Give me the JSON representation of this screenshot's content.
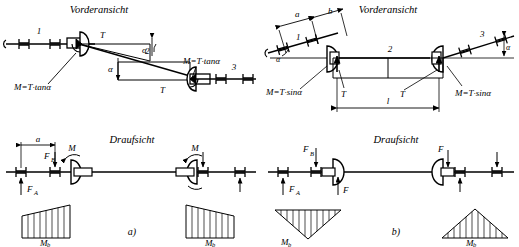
{
  "figure": {
    "panels": [
      "a)",
      "b)"
    ],
    "line_color": "#000000",
    "hatch_color": "#000000",
    "background": "#ffffff"
  },
  "panel_a": {
    "caption": "a)",
    "front_view": {
      "title": "Vorderansicht",
      "shaft_labels": [
        "1",
        "2",
        "3"
      ],
      "angle_labels": [
        "α",
        "α"
      ],
      "torque_labels": [
        "T",
        "T"
      ],
      "moment_labels": [
        "M=T·tanα",
        "M=T·tanα"
      ]
    },
    "top_view": {
      "title": "Draufsicht",
      "dimension_labels": [
        "a"
      ],
      "force_labels": [
        "F",
        "F"
      ],
      "force_sub_labels": [
        "F",
        "F"
      ],
      "reaction_a": "F",
      "reaction_a_sub": "A",
      "reaction_b": "F",
      "reaction_b_sub": "B",
      "moment_labels": [
        "M",
        "M"
      ]
    },
    "moment_diagrams": [
      {
        "name": "left",
        "label": "M",
        "sub": "b",
        "shape": "trapezoid-rising"
      },
      {
        "name": "right",
        "label": "M",
        "sub": "b",
        "shape": "trapezoid-falling"
      }
    ]
  },
  "panel_b": {
    "caption": "b)",
    "front_view": {
      "title": "Vorderansicht",
      "shaft_labels": [
        "1",
        "2",
        "3"
      ],
      "angle_labels": [
        "α",
        "α"
      ],
      "dimension_labels": [
        "a",
        "b",
        "l"
      ],
      "torque_labels": [
        "T",
        "T"
      ],
      "moment_labels": [
        "M=T·sinα",
        "M=T·sinα"
      ]
    },
    "top_view": {
      "title": "Draufsicht",
      "reaction_a": "F",
      "reaction_a_sub": "A",
      "reaction_b": "F",
      "reaction_b_sub": "B",
      "force_labels": [
        "F",
        "F"
      ]
    },
    "moment_diagrams": [
      {
        "name": "left",
        "label": "M",
        "sub": "b",
        "shape": "triangle-down"
      },
      {
        "name": "right",
        "label": "M",
        "sub": "b",
        "shape": "triangle-up"
      }
    ]
  },
  "symbols": {
    "bearing": "bearing-bracket-pair",
    "coupling": "half-disc-coupling",
    "arrow": "arrow-head"
  }
}
